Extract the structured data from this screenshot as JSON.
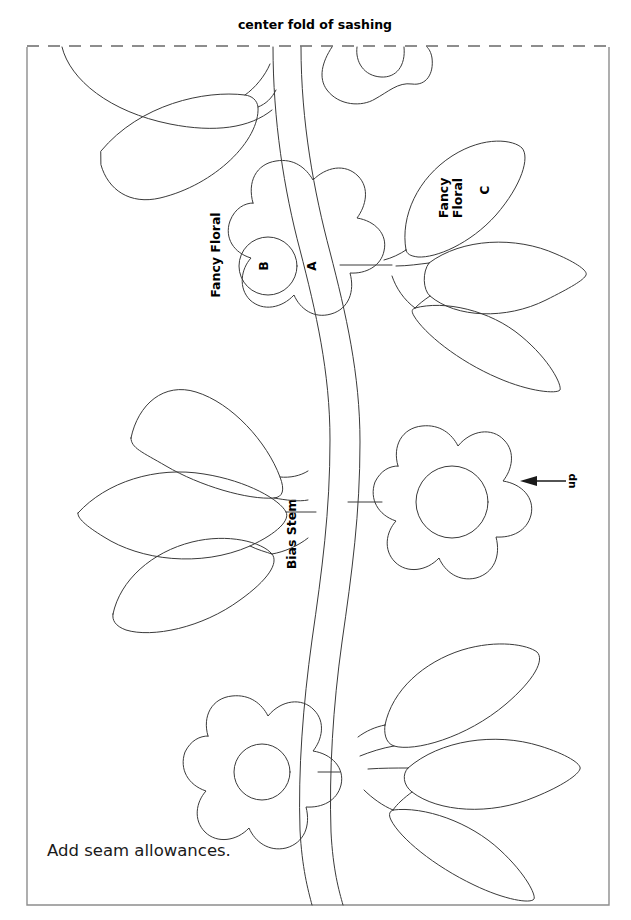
{
  "page": {
    "width": 631,
    "height": 920,
    "background": "#ffffff",
    "line_color": "#3a3a3a",
    "frame_color": "#8d8d8d",
    "text_color": "#000000"
  },
  "title": {
    "text": "center fold of sashing"
  },
  "fold": {
    "style": "dashed",
    "label": "center fold of sashing"
  },
  "note": {
    "text": "Add seam allowances."
  },
  "orientation": {
    "label": "up",
    "arrow": "left-arrow"
  },
  "labels": {
    "top_flower_fabric": "Fancy Floral",
    "top_flower_petal_piece": "A",
    "top_flower_center_piece": "B",
    "leaf_fabric_line1": "Fancy",
    "leaf_fabric_line2": "Floral",
    "leaf_piece": "C",
    "stem": "Bias Stem"
  },
  "pieces": [
    {
      "id": "A",
      "name": "flower petal",
      "fabric": "Fancy Floral"
    },
    {
      "id": "B",
      "name": "flower center",
      "fabric": "Fancy Floral"
    },
    {
      "id": "C",
      "name": "leaf",
      "fabric": "Fancy Floral"
    }
  ],
  "elements": {
    "flowers": 4,
    "leaves": 9,
    "stems": 1
  }
}
